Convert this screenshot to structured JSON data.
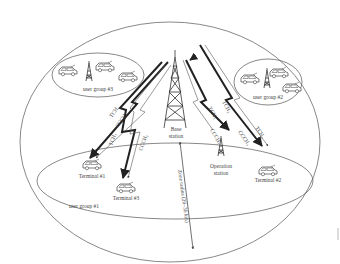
{
  "diagram": {
    "type": "wireless-zone-network",
    "base_station": {
      "label_line1": "Base",
      "label_line2": "station"
    },
    "operation_station": {
      "label_line1": "Operation",
      "label_line2": "station"
    },
    "user_groups": [
      {
        "label": "user group #3"
      },
      {
        "label": "user group #2"
      },
      {
        "label": "user group #1"
      }
    ],
    "terminals": [
      {
        "label": "Terminal #1"
      },
      {
        "label": "Terminal #3"
      },
      {
        "label": "Terminal #2"
      }
    ],
    "channels": {
      "tch1": "TCH₁",
      "cch1": "CCCH₁",
      "tch1b": "TCH₁",
      "cch1b": "CCCH₁",
      "tch2": "TCH₂",
      "tch3": "TCH₃",
      "cch3": "CCCH₃",
      "tch3b": "TCH₃"
    },
    "zone_radius_label": "Zone radius (20–30 km)",
    "colors": {
      "line": "#333333",
      "thin": "#666666",
      "background": "#ffffff"
    }
  }
}
